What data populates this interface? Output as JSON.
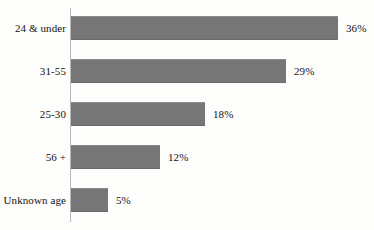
{
  "chart_data": {
    "type": "bar",
    "orientation": "horizontal",
    "title": "",
    "subtitle": "",
    "xlabel": "",
    "ylabel": "",
    "categories": [
      "24 & under",
      "31-55",
      "25-30",
      "56 +",
      "Unknown age"
    ],
    "values": [
      36,
      29,
      18,
      12,
      5
    ],
    "value_labels": [
      "36%",
      "29%",
      "18%",
      "12%",
      "5%"
    ],
    "unit": "%",
    "xlim": [
      0,
      40
    ],
    "grid": false,
    "legend": null,
    "legend_position": "none",
    "annotations": [],
    "series": [
      {
        "name": "Share of respondents",
        "values": [
          36,
          29,
          18,
          12,
          5
        ]
      }
    ]
  },
  "style": {
    "bar_color": "#767676",
    "axis_color": "#b9b9b9",
    "text_color": "#15130f",
    "background": "#fdfdfc"
  },
  "rows": [
    {
      "label": "24 & under",
      "value": 36,
      "value_label": "36%"
    },
    {
      "label": "31-55",
      "value": 29,
      "value_label": "29%"
    },
    {
      "label": "25-30",
      "value": 18,
      "value_label": "18%"
    },
    {
      "label": "56 +",
      "value": 12,
      "value_label": "12%"
    },
    {
      "label": "Unknown age",
      "value": 5,
      "value_label": "5%"
    }
  ]
}
